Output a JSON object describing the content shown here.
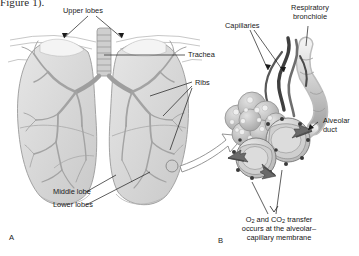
{
  "figure": {
    "clipped_header": "Figure 1).",
    "background_color": "#ffffff",
    "tissue_color": "#d8d8d8",
    "bronchi_color": "#a8a8a8",
    "vessel_dark_color": "#4a4a4a",
    "line_color": "#1a1a1a"
  },
  "panel_a": {
    "id": "A",
    "name": "lungs-overview",
    "labels": {
      "upper_lobes": "Upper lobes",
      "trachea": "Trachea",
      "ribs": "Ribs",
      "middle_lobe": "Middle lobe",
      "lower_lobes": "Lower lobes"
    }
  },
  "panel_b": {
    "id": "B",
    "name": "alveoli-detail",
    "labels": {
      "capillaries": "Capillaries",
      "respiratory_bronchiole": "Respiratory bronchiole",
      "alveolar_duct": "Alveolar duct"
    },
    "caption_line1": "O",
    "caption_sub1": "2",
    "caption_mid": " and CO",
    "caption_sub2": "2",
    "caption_end": " transfer",
    "caption_line2": "occurs at the alveolar–",
    "caption_line3": "capillary membrane"
  }
}
